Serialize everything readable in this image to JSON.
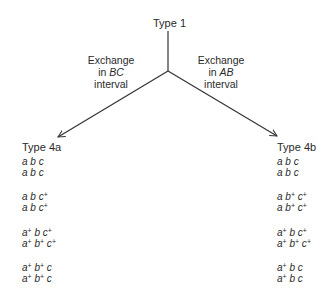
{
  "diagram": {
    "root": {
      "label": "Type 1"
    },
    "branches": [
      {
        "edge_label": [
          "Exchange",
          "in BC",
          "interval"
        ],
        "edge_label_italic": "BC",
        "result": {
          "label": "Type 4a",
          "pairs": [
            [
              "a b c",
              "a b c"
            ],
            [
              "a b c+",
              "a b c+"
            ],
            [
              "a+ b c+",
              "a+ b+ c+"
            ],
            [
              "a+ b+ c",
              "a+ b+ c"
            ]
          ]
        }
      },
      {
        "edge_label": [
          "Exchange",
          "in AB",
          "interval"
        ],
        "edge_label_italic": "AB",
        "result": {
          "label": "Type 4b",
          "pairs": [
            [
              "a b c",
              "a b c"
            ],
            [
              "a b+ c+",
              "a b+ c+"
            ],
            [
              "a+ b c+",
              "a+ b+ c+"
            ],
            [
              "a+ b c",
              "a+ b c"
            ]
          ]
        }
      }
    ]
  },
  "text": {
    "root": "Type 1",
    "exchange": "Exchange",
    "in": "in",
    "bc": "BC",
    "ab": "AB",
    "interval": "interval",
    "type4a": "Type 4a",
    "type4b": "Type 4b"
  }
}
